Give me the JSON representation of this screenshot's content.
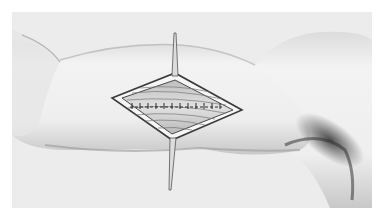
{
  "image": {
    "subject": "surgical illustration of an upper arm with a diamond-shaped incision held open by two retractor needles, showing sutured muscle fibers",
    "colors": {
      "page_background": "#ffffff",
      "frame_background": "#ececec",
      "skin_light": "#f1f1f1",
      "skin_shadow": "#9a9a9a",
      "wound_interior": "#d8d8d8",
      "wound_edge": "#3a3a3a",
      "suture": "#2a2a2a"
    },
    "elements": {
      "arm": "upper-arm",
      "incision": "diamond-shaped-open-incision",
      "sutures": "row-of-interrupted-sutures",
      "retractors": [
        "top-needle-retractor",
        "bottom-needle-retractor"
      ]
    }
  }
}
